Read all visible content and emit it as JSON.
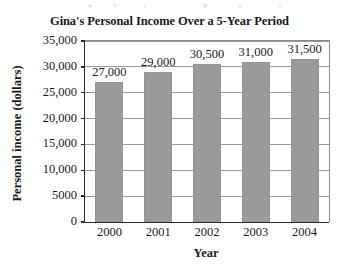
{
  "chart_data": {
    "type": "bar",
    "title": "Gina's Personal Income Over a 5-Year Period",
    "xlabel": "Year",
    "ylabel": "Personal income (dollars)",
    "categories": [
      "2000",
      "2001",
      "2002",
      "2003",
      "2004"
    ],
    "values": [
      27000,
      29000,
      30500,
      31000,
      31500
    ],
    "value_labels": [
      "27,000",
      "29,000",
      "30,500",
      "31,000",
      "31,500"
    ],
    "ylim": [
      0,
      35000
    ],
    "ytick_values": [
      0,
      5000,
      10000,
      15000,
      20000,
      25000,
      30000,
      35000
    ],
    "ytick_labels": [
      "0",
      "5000",
      "10,000",
      "15,000",
      "20,000",
      "25,000",
      "30,000",
      "35,000"
    ],
    "grid": true,
    "legend": null,
    "bar_color": "#999a9b",
    "axis_color": "#2b2b2b",
    "grid_color": "#9a9a9a",
    "background_color": "#ffffff"
  }
}
